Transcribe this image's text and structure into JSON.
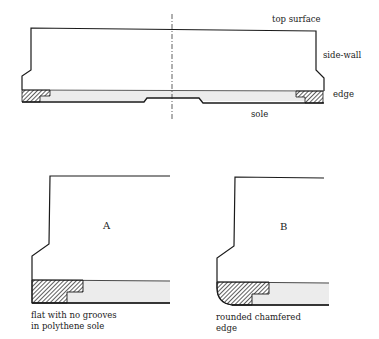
{
  "main_diagram": {
    "labels": {
      "top_surface": "top surface",
      "side_wall": "side-wall",
      "edge": "edge",
      "sole": "sole"
    }
  },
  "detail_a": {
    "letter": "A",
    "caption_line1": "flat with no grooves",
    "caption_line2": "in polythene sole"
  },
  "detail_b": {
    "letter": "B",
    "caption_line1": "rounded chamfered",
    "caption_line2": "edge"
  },
  "colors": {
    "line": "#1a1a1a",
    "sole_fill": "#ececec",
    "hatch": "#1a1a1a"
  }
}
